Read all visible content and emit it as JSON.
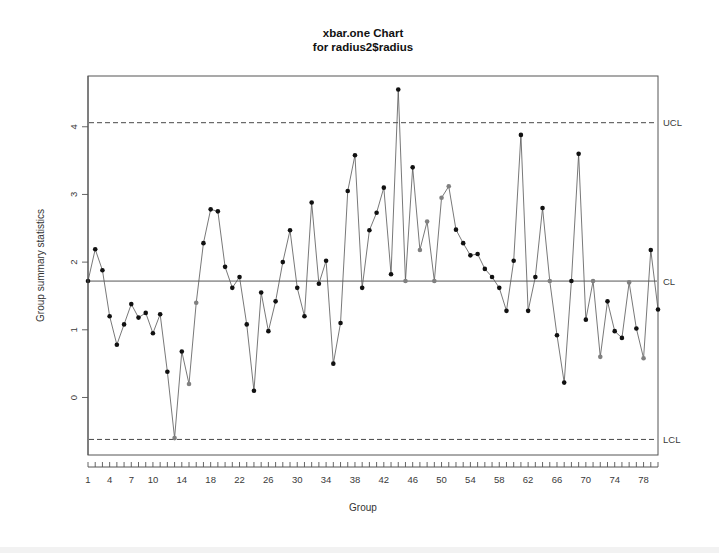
{
  "chart_data": {
    "type": "line",
    "title": "xbar.one Chart",
    "subtitle": "for radius2$radius",
    "xlabel": "Group",
    "ylabel": "Group summary statistics",
    "xlim": [
      1,
      80
    ],
    "ylim": [
      -0.85,
      4.75
    ],
    "grid": false,
    "legend_position": "none",
    "x_tick_labels": [
      "1",
      "4",
      "7",
      "10",
      "14",
      "18",
      "22",
      "26",
      "30",
      "34",
      "38",
      "42",
      "46",
      "50",
      "54",
      "58",
      "62",
      "66",
      "70",
      "74",
      "78"
    ],
    "x_tick_values": [
      1,
      4,
      7,
      10,
      14,
      18,
      22,
      26,
      30,
      34,
      38,
      42,
      46,
      50,
      54,
      58,
      62,
      66,
      70,
      74,
      78
    ],
    "x_minor_ticks_every": 1,
    "y_tick_labels": [
      "0",
      "1",
      "2",
      "3",
      "4"
    ],
    "y_tick_values": [
      0,
      1,
      2,
      3,
      4
    ],
    "control_limits": {
      "ucl": {
        "label": "UCL",
        "value": 4.06
      },
      "cl": {
        "label": "CL",
        "value": 1.72
      },
      "lcl": {
        "label": "LCL",
        "value": -0.62
      }
    },
    "colors": {
      "point_in_control": "#111111",
      "point_violation": "#808080",
      "line": "#555555",
      "frame": "#555555",
      "limit_line": "#333333"
    },
    "series": [
      {
        "name": "radius2$radius",
        "x": [
          1,
          2,
          3,
          4,
          5,
          6,
          7,
          8,
          9,
          10,
          11,
          12,
          13,
          14,
          15,
          16,
          17,
          18,
          19,
          20,
          21,
          22,
          23,
          24,
          25,
          26,
          27,
          28,
          29,
          30,
          31,
          32,
          33,
          34,
          35,
          36,
          37,
          38,
          39,
          40,
          41,
          42,
          43,
          44,
          45,
          46,
          47,
          48,
          49,
          50,
          51,
          52,
          53,
          54,
          55,
          56,
          57,
          58,
          59,
          60,
          61,
          62,
          63,
          64,
          65,
          66,
          67,
          68,
          69,
          70,
          71,
          72,
          73,
          74,
          75,
          76,
          77,
          78,
          79,
          80
        ],
        "values": [
          1.72,
          2.19,
          1.88,
          1.2,
          0.78,
          1.08,
          1.38,
          1.18,
          1.25,
          0.95,
          1.23,
          0.38,
          -0.6,
          0.68,
          0.2,
          1.4,
          2.28,
          2.78,
          2.75,
          1.93,
          1.62,
          1.78,
          1.08,
          0.1,
          1.55,
          0.98,
          1.42,
          2.0,
          2.47,
          1.62,
          1.2,
          2.88,
          1.68,
          2.02,
          0.5,
          1.1,
          3.05,
          3.58,
          1.62,
          2.47,
          2.73,
          3.1,
          1.82,
          4.55,
          1.72,
          3.4,
          2.18,
          2.6,
          1.72,
          2.95,
          3.12,
          2.48,
          2.28,
          2.1,
          2.12,
          1.9,
          1.78,
          1.62,
          1.28,
          2.02,
          3.88,
          1.28,
          1.78,
          2.8,
          1.72,
          0.92,
          0.22,
          1.72,
          3.6,
          1.15,
          1.72,
          0.6,
          1.42,
          0.98,
          0.88,
          1.7,
          1.02,
          0.58,
          2.18,
          1.3
        ],
        "violation_flags": [
          false,
          false,
          false,
          false,
          false,
          false,
          false,
          false,
          false,
          false,
          false,
          false,
          true,
          false,
          true,
          true,
          false,
          false,
          false,
          false,
          false,
          false,
          false,
          false,
          false,
          false,
          false,
          false,
          false,
          false,
          false,
          false,
          false,
          false,
          false,
          false,
          false,
          false,
          false,
          false,
          false,
          false,
          false,
          false,
          true,
          false,
          true,
          true,
          true,
          true,
          true,
          false,
          false,
          false,
          false,
          false,
          false,
          false,
          false,
          false,
          false,
          false,
          false,
          false,
          true,
          false,
          false,
          false,
          false,
          false,
          true,
          true,
          false,
          false,
          false,
          true,
          false,
          true,
          false,
          false
        ]
      }
    ]
  }
}
